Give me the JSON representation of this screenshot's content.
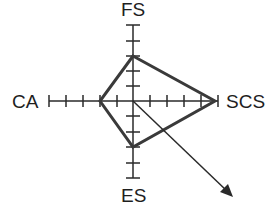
{
  "diagram": {
    "type": "radar",
    "center": [
      133,
      101
    ],
    "axes": [
      {
        "key": "FS",
        "label": "FS",
        "direction": "up",
        "ticks": 5,
        "value": 3
      },
      {
        "key": "SCS",
        "label": "SCS",
        "direction": "right",
        "ticks": 5,
        "value": 5
      },
      {
        "key": "ES",
        "label": "ES",
        "direction": "down",
        "ticks": 5,
        "value": 3
      },
      {
        "key": "CA",
        "label": "CA",
        "direction": "left",
        "ticks": 5,
        "value": 2
      }
    ],
    "arrow": {
      "from": "center",
      "direction": "down-right"
    },
    "colors": {
      "axis": "#2a2a2a",
      "polygon": "#3a3a3a",
      "text": "#1e1e1e",
      "background": "#ffffff"
    }
  }
}
